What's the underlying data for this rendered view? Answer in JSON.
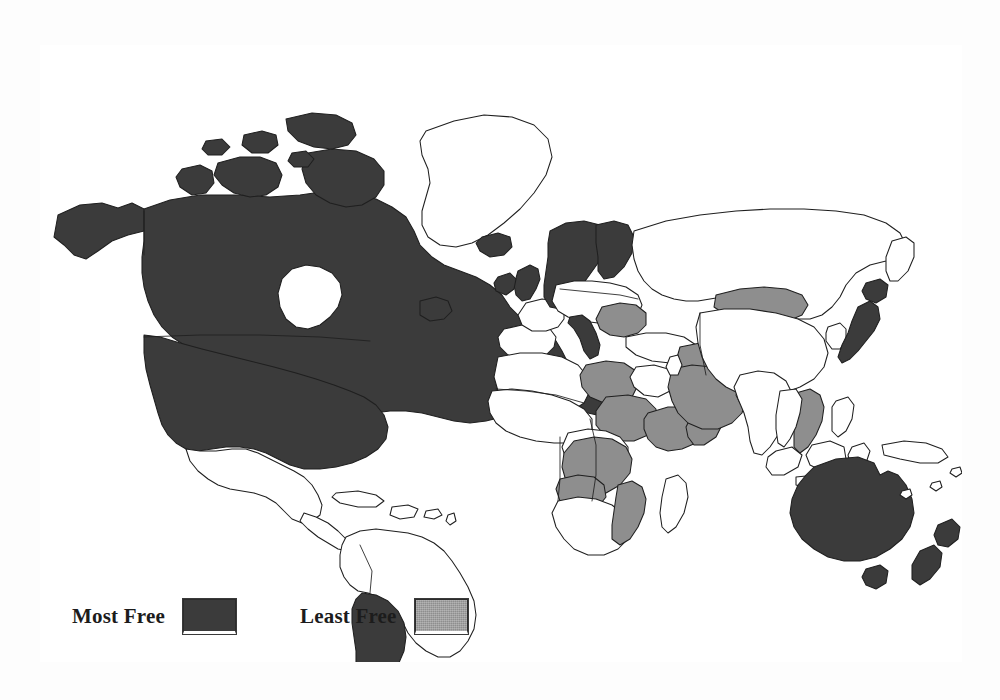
{
  "figure": {
    "kind": "choropleth-world-map",
    "frame": {
      "border_color": "#3a3a3a",
      "background": "#ffffff"
    },
    "page_background": "#fdfdfd"
  },
  "legend": {
    "entries": [
      {
        "label": "Most Free",
        "swatch_color": "#3b3b3b",
        "class_key": "most"
      },
      {
        "label": "Least Free",
        "swatch_color": "#8e8e8e",
        "class_key": "least"
      }
    ]
  },
  "map_data": {
    "type": "choropleth",
    "categories": [
      "Most Free",
      "Least Free",
      "Unshaded"
    ],
    "colors": {
      "Most Free": "#3b3b3b",
      "Least Free": "#8e8e8e",
      "Unshaded": "#ffffff"
    },
    "regions": {
      "most_free": [
        "United States",
        "Canada",
        "Alaska",
        "Iceland",
        "Ireland",
        "United Kingdom",
        "Norway",
        "Sweden",
        "Finland",
        "Italy",
        "Japan",
        "Australia",
        "Tasmania",
        "New Zealand",
        "Argentina"
      ],
      "least_free": [
        "Romania",
        "Bulgaria",
        "Syria",
        "Iraq",
        "Saudi Arabia",
        "Libya",
        "Sudan",
        "Ethiopia",
        "Somalia",
        "Zaire",
        "Angola",
        "Mozambique",
        "Mongolia",
        "Vietnam",
        "Laos"
      ],
      "unshaded": [
        "Greenland",
        "Mexico",
        "Brazil",
        "China",
        "India",
        "Russia",
        "Spain",
        "France",
        "Germany",
        "South Africa"
      ]
    }
  }
}
